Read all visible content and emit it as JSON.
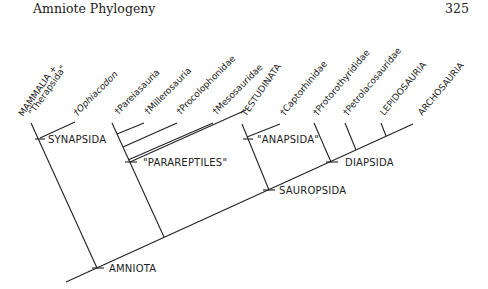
{
  "header": {
    "title": "Amniote Phylogeny",
    "page_number": "325"
  },
  "taxa": [
    {
      "label": "MAMMALIA +",
      "label2": "\"Therapsida\"",
      "extinct": false
    },
    {
      "label": "†Ophiacodon",
      "extinct": true,
      "italic": true
    },
    {
      "label": "†Pareiasauria",
      "extinct": true
    },
    {
      "label": "†Millerosauria",
      "extinct": true
    },
    {
      "label": "†Procolophonidae",
      "extinct": true
    },
    {
      "label": "†Mesosauridae",
      "extinct": true
    },
    {
      "label": "TESTUDINATA",
      "extinct": false
    },
    {
      "label": "†Captorhinidae",
      "extinct": true
    },
    {
      "label": "†Protorothyrididae",
      "extinct": true
    },
    {
      "label": "†Petrolacosauridae",
      "extinct": true
    },
    {
      "label": "LEPIDOSAURIA",
      "extinct": false
    },
    {
      "label": "ARCHOSAURIA",
      "extinct": false
    }
  ],
  "nodes": {
    "synapsida": "SYNAPSIDA",
    "parareptiles": "\"PARAREPTILES\"",
    "anapsida": "\"ANAPSIDA\"",
    "diapsida": "DIAPSIDA",
    "sauropsida": "SAUROPSIDA",
    "amniota": "AMNIOTA"
  }
}
